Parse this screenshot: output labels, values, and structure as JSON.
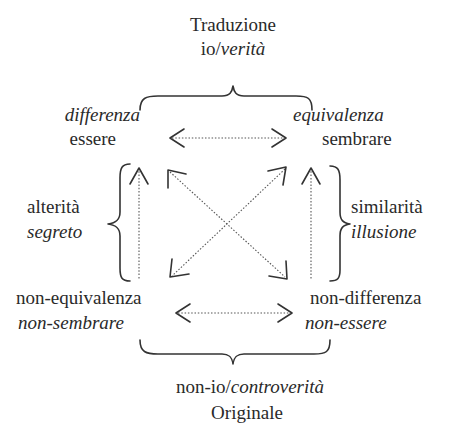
{
  "top": {
    "title": "Traduzione",
    "subtitle_plain": "io/",
    "subtitle_italic": "verità"
  },
  "corners": {
    "top_left": {
      "italic": "differenza",
      "plain": "essere"
    },
    "top_right": {
      "italic": "equivalenza",
      "plain": "sembrare"
    },
    "bottom_left": {
      "plain": "non-equivalenza",
      "italic": "non-sembrare"
    },
    "bottom_right": {
      "plain": "non-differenza",
      "italic": "non-essere"
    }
  },
  "sides": {
    "left": {
      "plain": "alterità",
      "italic": "segreto"
    },
    "right": {
      "plain": "similarità",
      "italic": "illusione"
    }
  },
  "bottom": {
    "subtitle_plain": "non-io/",
    "subtitle_italic": "controverità",
    "title": "Originale"
  },
  "colors": {
    "text": "#2a2a2a",
    "line": "#444444"
  }
}
